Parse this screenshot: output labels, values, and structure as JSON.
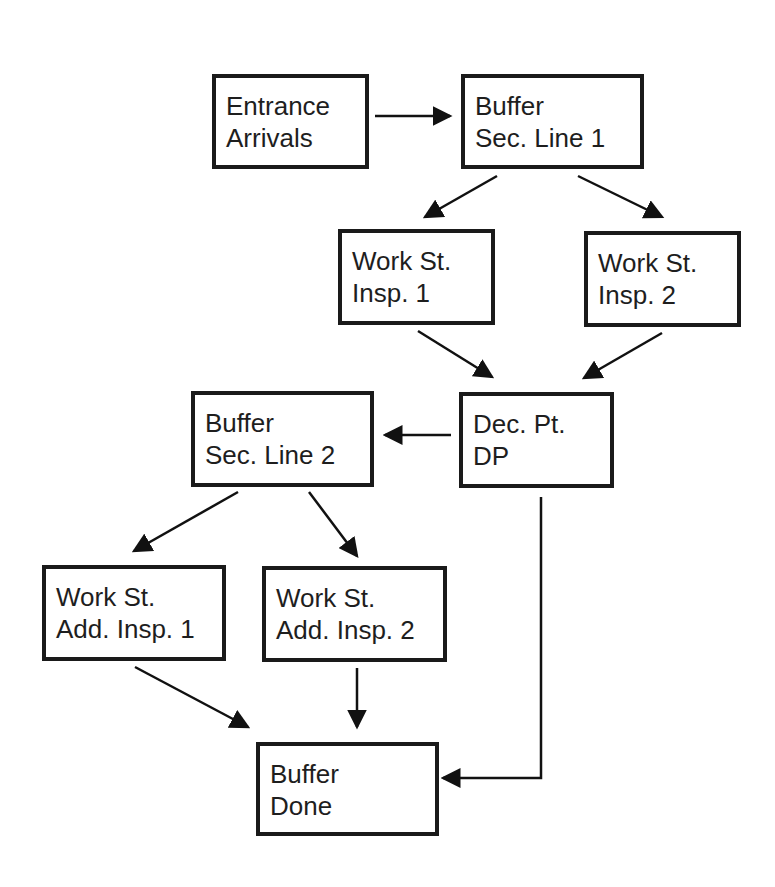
{
  "diagram": {
    "nodes": [
      {
        "id": "entrance",
        "line1": "Entrance",
        "line2": "Arrivals",
        "x": 212,
        "y": 74,
        "w": 157,
        "h": 95
      },
      {
        "id": "buffer1",
        "line1": "Buffer",
        "line2": "Sec. Line 1",
        "x": 461,
        "y": 74,
        "w": 183,
        "h": 95
      },
      {
        "id": "ws1",
        "line1": "Work St.",
        "line2": "Insp. 1",
        "x": 338,
        "y": 229,
        "w": 157,
        "h": 96
      },
      {
        "id": "ws2",
        "line1": "Work St.",
        "line2": "Insp. 2",
        "x": 584,
        "y": 231,
        "w": 157,
        "h": 96
      },
      {
        "id": "dp",
        "line1": "Dec. Pt.",
        "line2": "DP",
        "x": 459,
        "y": 392,
        "w": 155,
        "h": 96
      },
      {
        "id": "buffer2",
        "line1": "Buffer",
        "line2": "Sec. Line 2",
        "x": 191,
        "y": 391,
        "w": 183,
        "h": 96
      },
      {
        "id": "add1",
        "line1": "Work St.",
        "line2": "Add. Insp. 1",
        "x": 42,
        "y": 565,
        "w": 184,
        "h": 96
      },
      {
        "id": "add2",
        "line1": "Work St.",
        "line2": "Add. Insp. 2",
        "x": 262,
        "y": 566,
        "w": 185,
        "h": 96
      },
      {
        "id": "done",
        "line1": "Buffer",
        "line2": "Done",
        "x": 256,
        "y": 742,
        "w": 183,
        "h": 94
      }
    ],
    "edges": [
      {
        "from": "entrance",
        "to": "buffer1",
        "points": [
          [
            375,
            116
          ],
          [
            450,
            116
          ]
        ]
      },
      {
        "from": "buffer1",
        "to": "ws1",
        "points": [
          [
            497,
            176
          ],
          [
            425,
            217
          ]
        ]
      },
      {
        "from": "buffer1",
        "to": "ws2",
        "points": [
          [
            578,
            176
          ],
          [
            662,
            217
          ]
        ]
      },
      {
        "from": "ws1",
        "to": "dp",
        "points": [
          [
            418,
            331
          ],
          [
            492,
            377
          ]
        ]
      },
      {
        "from": "ws2",
        "to": "dp",
        "points": [
          [
            662,
            333
          ],
          [
            584,
            378
          ]
        ]
      },
      {
        "from": "dp",
        "to": "buffer2",
        "points": [
          [
            451,
            435
          ],
          [
            385,
            435
          ]
        ]
      },
      {
        "from": "buffer2",
        "to": "add1",
        "points": [
          [
            238,
            492
          ],
          [
            134,
            551
          ]
        ]
      },
      {
        "from": "buffer2",
        "to": "add2",
        "points": [
          [
            309,
            492
          ],
          [
            357,
            556
          ]
        ]
      },
      {
        "from": "add1",
        "to": "done",
        "points": [
          [
            135,
            667
          ],
          [
            248,
            727
          ]
        ]
      },
      {
        "from": "add2",
        "to": "done",
        "points": [
          [
            357,
            668
          ],
          [
            357,
            727
          ]
        ]
      },
      {
        "from": "dp",
        "to": "done",
        "points": [
          [
            541,
            497
          ],
          [
            541,
            778
          ],
          [
            443,
            778
          ]
        ]
      }
    ]
  }
}
